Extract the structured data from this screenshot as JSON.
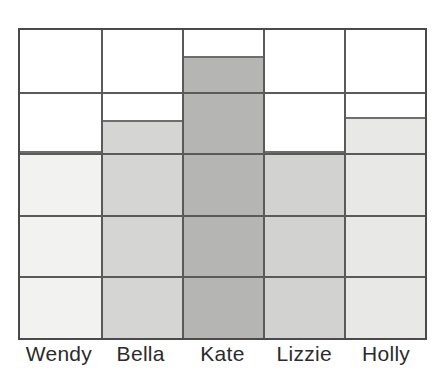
{
  "chart_data": {
    "type": "bar",
    "title": "",
    "subtitle": "",
    "xlabel": "",
    "ylabel": "",
    "categories": [
      "Wendy",
      "Bella",
      "Kate",
      "Lizzie",
      "Holly"
    ],
    "values": [
      3,
      3.5,
      4.55,
      3,
      3.55
    ],
    "ylim": [
      0,
      5
    ],
    "grid": "full 5x5 cell grid, both horizontal and vertical gridlines",
    "legend": "none",
    "series": [
      {
        "name": "Favourite count",
        "values": [
          3,
          3.5,
          4.55,
          3,
          3.55
        ]
      }
    ],
    "bars": [
      {
        "category": "Wendy",
        "value": 3,
        "fill_color": "#f2f2f0",
        "edge_color": "#6e6e6e"
      },
      {
        "category": "Bella",
        "value": 3.5,
        "fill_color": "#d5d5d3",
        "edge_color": "#6e6e6e"
      },
      {
        "category": "Kate",
        "value": 4.55,
        "fill_color": "#b5b5b3",
        "edge_color": "#6e6e6e"
      },
      {
        "category": "Lizzie",
        "value": 3,
        "fill_color": "#d2d2d0",
        "edge_color": "#6e6e6e"
      },
      {
        "category": "Holly",
        "value": 3.55,
        "fill_color": "#e8e8e6",
        "edge_color": "#6e6e6e"
      }
    ],
    "rows": 5,
    "columns": 5,
    "frame_color": "#4a4a4a",
    "gridline_color": "#5a5a5a",
    "background_color": "#ffffff"
  },
  "axis": {
    "x_tick_labels": [
      "Wendy",
      "Bella",
      "Kate",
      "Lizzie",
      "Holly"
    ]
  }
}
